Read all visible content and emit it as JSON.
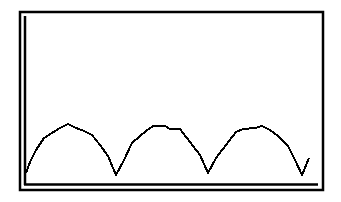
{
  "colors": {
    "background": "#ffffff",
    "line": "#000000",
    "frame": "#000000"
  },
  "chart_data": {
    "type": "line",
    "title": "",
    "xlabel": "",
    "ylabel": "",
    "grid": false,
    "legend": null,
    "axis_ranges": {
      "x": [
        0,
        293
      ],
      "y": [
        0,
        172
      ]
    },
    "x_ticks": [],
    "y_ticks": [],
    "series": [
      {
        "name": "waveform",
        "x": [
          1,
          5,
          11,
          19,
          27,
          35,
          43,
          51,
          59,
          67,
          75,
          83,
          91,
          99,
          107,
          115,
          121,
          128,
          140,
          145,
          155,
          165,
          175,
          183,
          191,
          201,
          211,
          218,
          230,
          237,
          245,
          253,
          263,
          271,
          277,
          284
        ],
        "values": [
          11,
          22,
          34,
          46,
          51,
          56,
          60,
          56,
          53,
          49,
          39,
          28,
          9,
          24,
          41,
          48,
          53,
          58,
          58,
          55,
          55,
          42,
          29,
          11,
          26,
          39,
          52,
          55,
          56,
          58,
          54,
          48,
          38,
          22,
          9,
          26
        ]
      }
    ]
  }
}
